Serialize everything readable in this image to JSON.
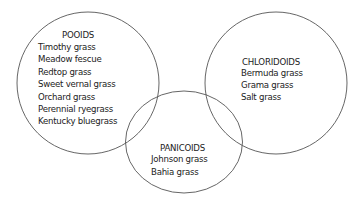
{
  "diagram": {
    "type": "venn",
    "stroke_color": "#555555",
    "text_color": "#222222",
    "groups": [
      {
        "id": "pooids",
        "label": "POOIDS",
        "items": [
          "Timothy grass",
          "Meadow fescue",
          "Redtop grass",
          "Sweet vernal grass",
          "Orchard grass",
          "Perennial ryegrass",
          "Kentucky bluegrass"
        ]
      },
      {
        "id": "chloridoids",
        "label": "CHLORIDOIDS",
        "items": [
          "Bermuda grass",
          "Grama grass",
          "Salt grass"
        ]
      },
      {
        "id": "panicoids",
        "label": "PANICOIDS",
        "items": [
          "Johnson grass",
          "Bahia grass"
        ]
      }
    ]
  }
}
